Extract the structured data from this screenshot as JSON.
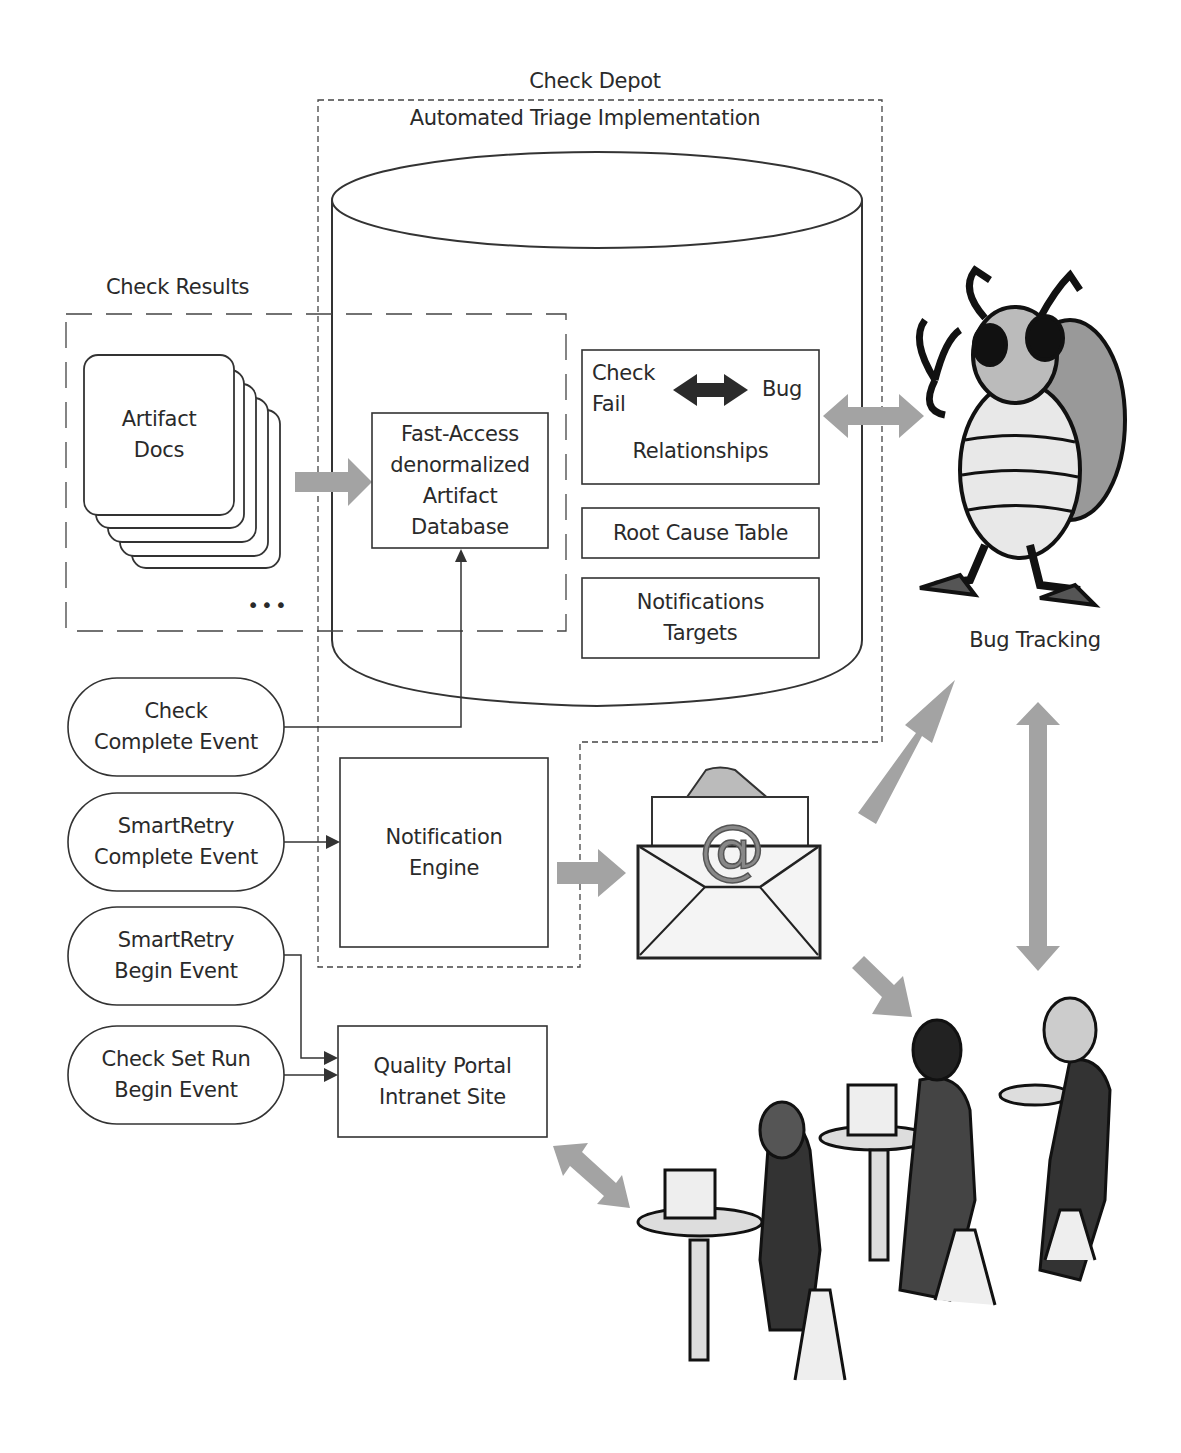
{
  "diagram": {
    "title": "Check Depot",
    "subtitle": "Automated Triage Implementation",
    "check_results": {
      "label": "Check Results",
      "artifact_docs": "Artifact\nDocs",
      "ellipsis": "•••"
    },
    "database": {
      "fast_access": "Fast-Access\ndenormalized\nArtifact\nDatabase",
      "relationships": {
        "left": "Check\nFail",
        "right": "Bug",
        "caption": "Relationships"
      },
      "root_cause": "Root Cause Table",
      "notifications_targets": "Notifications\nTargets"
    },
    "events": [
      {
        "label": "Check\nComplete Event"
      },
      {
        "label": "SmartRetry\nComplete Event"
      },
      {
        "label": "SmartRetry\nBegin Event"
      },
      {
        "label": "Check Set Run\nBegin Event"
      }
    ],
    "notification_engine": "Notification\nEngine",
    "quality_portal": "Quality Portal\nIntranet Site",
    "bug_tracking": "Bug Tracking",
    "email_icon_glyph": "@",
    "colors": {
      "line": "#333333",
      "flow_arrow": "#a3a3a3",
      "dark_arrow": "#2b2b2b"
    }
  }
}
